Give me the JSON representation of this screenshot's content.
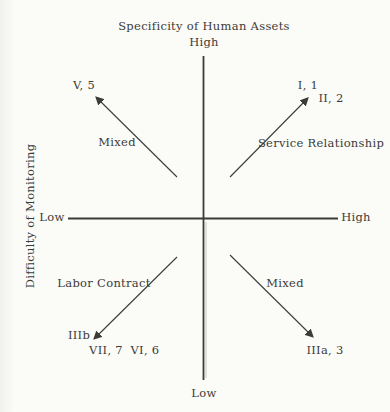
{
  "figure": {
    "vertical_axis": {
      "title": "Specificity of Human Assets",
      "top_label": "High",
      "bottom_label": "Low"
    },
    "horizontal_axis": {
      "title": "Difficulty of Monitoring",
      "left_label": "Low",
      "right_label": "High"
    },
    "quadrants": {
      "top_left": {
        "name": "Mixed",
        "point_1": "V, 5"
      },
      "top_right": {
        "name": "Service Relationship",
        "point_1": "I, 1",
        "point_2": "II, 2"
      },
      "bottom_left": {
        "name": "Labor Contract",
        "point_1": "IIIb",
        "point_2": "VII, 7",
        "point_3": "VI, 6"
      },
      "bottom_right": {
        "name": "Mixed",
        "point_1": "IIIa, 3"
      }
    },
    "colors": {
      "ink": "#3b3b37",
      "paper": "#fbfbf8"
    }
  }
}
